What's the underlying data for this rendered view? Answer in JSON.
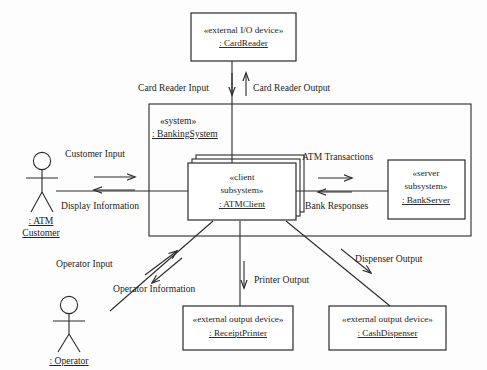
{
  "diagram": {
    "type": "uml-communication-diagram",
    "colors": {
      "background": "#fdfdfd",
      "stroke": "#2b2b2b",
      "text": "#1d1d1d",
      "box_fill": "#ffffff"
    }
  },
  "nodes": {
    "card_reader": {
      "stereotype": "«external I/O device»",
      "name": ": CardReader"
    },
    "banking_system": {
      "stereotype": "«system»",
      "name": ": BankingSystem"
    },
    "atm_client": {
      "stereotype_line1": "«client",
      "stereotype_line2": "subsystem»",
      "name": ": ATMClient"
    },
    "bank_server": {
      "stereotype_line1": "«server",
      "stereotype_line2": "subsystem»",
      "name": ": BankServer"
    },
    "receipt_printer": {
      "stereotype": "«external output device»",
      "name": ": ReceiptPrinter"
    },
    "cash_dispenser": {
      "stereotype": "«external output device»",
      "name": ": CashDispenser"
    }
  },
  "actors": {
    "atm_customer": {
      "name_line1": ": ATM",
      "name_line2": "Customer"
    },
    "operator": {
      "name": ": Operator"
    }
  },
  "messages": {
    "card_reader_input": "Card Reader Input",
    "card_reader_output": "Card Reader Output",
    "customer_input": "Customer Input",
    "display_information": "Display Information",
    "atm_transactions": "ATM Transactions",
    "bank_responses": "Bank Responses",
    "operator_input": "Operator Input",
    "operator_information": "Operator Information",
    "printer_output": "Printer Output",
    "dispenser_output": "Dispenser Output"
  }
}
